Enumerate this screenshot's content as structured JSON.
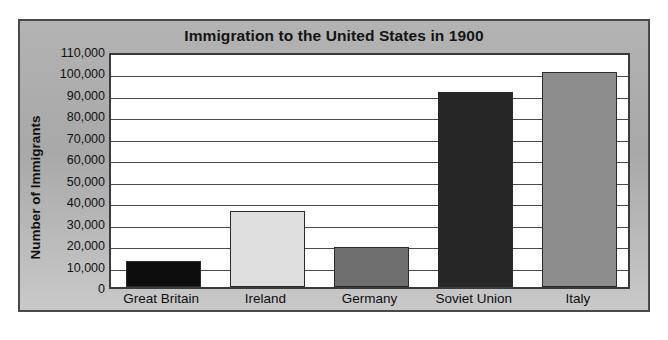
{
  "chart_data": {
    "type": "bar",
    "title": "Immigration to the United States in 1900",
    "xlabel": "",
    "ylabel": "Number of Immigrants",
    "categories": [
      "Great Britain",
      "Ireland",
      "Germany",
      "Soviet Union",
      "Italy"
    ],
    "values": [
      12000,
      35500,
      18500,
      91000,
      100000
    ],
    "series": [
      {
        "name": "Number of Immigrants",
        "values": [
          12000,
          35500,
          18500,
          91000,
          100000
        ]
      }
    ],
    "bar_colors": [
      "#0d0d0d",
      "#dedede",
      "#6e6e6e",
      "#262626",
      "#8c8c8c"
    ],
    "ylim": [
      0,
      110000
    ],
    "ytick_values": [
      0,
      10000,
      20000,
      30000,
      40000,
      50000,
      60000,
      70000,
      80000,
      90000,
      100000,
      110000
    ],
    "ytick_labels": [
      "0",
      "10,000",
      "20,000",
      "30,000",
      "40,000",
      "50,000",
      "60,000",
      "70,000",
      "80,000",
      "90,000",
      "100,000",
      "110,000"
    ],
    "grid": true,
    "grid_axis": "y",
    "legend": false,
    "legend_position": "none",
    "plot_background": "#ffffff",
    "panel_background": "#b0b0b0",
    "axis_color": "#3a3a3a"
  }
}
